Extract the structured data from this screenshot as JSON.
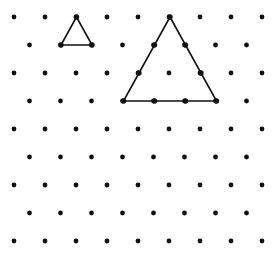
{
  "figure": {
    "name": "isometric-geoboard-with-two-equilateral-triangles",
    "width": 279,
    "height": 255,
    "background_color": "#ffffff",
    "ink_color": "#111111"
  },
  "lattice": {
    "description": "staggered triangular (isometric) dot grid",
    "rows": 9,
    "dots_per_even_row": 9,
    "dots_per_odd_row": 8,
    "total_dots": 77,
    "column_spacing": 31,
    "row_spacing": 28,
    "row_offset": 15.5,
    "origin_x": 14,
    "origin_y": 17,
    "dot_radius": 2.4,
    "dot_color": "#111111",
    "rows_data": [
      {
        "index": 0,
        "y": 17,
        "start_x": 14,
        "count": 9
      },
      {
        "index": 1,
        "y": 45,
        "start_x": 29.5,
        "count": 8
      },
      {
        "index": 2,
        "y": 73,
        "start_x": 14,
        "count": 9
      },
      {
        "index": 3,
        "y": 101,
        "start_x": 29.5,
        "count": 8
      },
      {
        "index": 4,
        "y": 129,
        "start_x": 14,
        "count": 9
      },
      {
        "index": 5,
        "y": 157,
        "start_x": 29.5,
        "count": 8
      },
      {
        "index": 6,
        "y": 185,
        "start_x": 14,
        "count": 9
      },
      {
        "index": 7,
        "y": 213,
        "start_x": 29.5,
        "count": 8
      },
      {
        "index": 8,
        "y": 241,
        "start_x": 14,
        "count": 9
      }
    ]
  },
  "shapes": [
    {
      "id": "small-triangle",
      "label": "small equilateral triangle",
      "type": "polygon",
      "side_units": 1,
      "stroke_width": 1.6,
      "stroke_color": "#111111",
      "fill": "none",
      "vertices": [
        {
          "x": 76.5,
          "y": 17
        },
        {
          "x": 61,
          "y": 45
        },
        {
          "x": 92,
          "y": 45
        }
      ],
      "edge_dots": [
        {
          "x": 76.5,
          "y": 17
        },
        {
          "x": 61,
          "y": 45
        },
        {
          "x": 92,
          "y": 45
        }
      ]
    },
    {
      "id": "large-triangle",
      "label": "large equilateral triangle",
      "type": "polygon",
      "side_units": 3,
      "stroke_width": 1.6,
      "stroke_color": "#111111",
      "fill": "none",
      "vertices": [
        {
          "x": 170,
          "y": 17
        },
        {
          "x": 123.5,
          "y": 101
        },
        {
          "x": 216.5,
          "y": 101
        }
      ],
      "edge_dots": [
        {
          "x": 170,
          "y": 17
        },
        {
          "x": 154.5,
          "y": 45
        },
        {
          "x": 139,
          "y": 73
        },
        {
          "x": 123.5,
          "y": 101
        },
        {
          "x": 154.5,
          "y": 101
        },
        {
          "x": 185.5,
          "y": 101
        },
        {
          "x": 216.5,
          "y": 101
        },
        {
          "x": 201,
          "y": 73
        },
        {
          "x": 185.5,
          "y": 45
        }
      ]
    }
  ]
}
